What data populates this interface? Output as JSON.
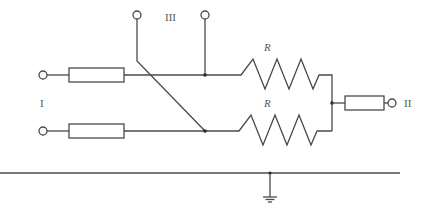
{
  "diagram": {
    "type": "circuit-schematic",
    "labels": {
      "port_input": "I",
      "port_output": "II",
      "port_control": "III",
      "resistor_top": "R",
      "resistor_bottom": "R"
    },
    "colors": {
      "line": "#4a4a4a",
      "junction": "#2a2a2a",
      "text": "#555555",
      "background": "#ffffff"
    },
    "components": [
      {
        "id": "input-terminal-top",
        "kind": "terminal"
      },
      {
        "id": "input-terminal-bottom",
        "kind": "terminal"
      },
      {
        "id": "input-impedance-top",
        "kind": "impedance-box"
      },
      {
        "id": "input-impedance-bottom",
        "kind": "impedance-box"
      },
      {
        "id": "control-terminal-left",
        "kind": "terminal"
      },
      {
        "id": "control-terminal-right",
        "kind": "terminal"
      },
      {
        "id": "resistor-top",
        "kind": "resistor",
        "label": "R"
      },
      {
        "id": "resistor-bottom",
        "kind": "resistor",
        "label": "R"
      },
      {
        "id": "output-impedance",
        "kind": "impedance-box"
      },
      {
        "id": "output-terminal",
        "kind": "terminal"
      },
      {
        "id": "ground",
        "kind": "ground"
      }
    ]
  }
}
